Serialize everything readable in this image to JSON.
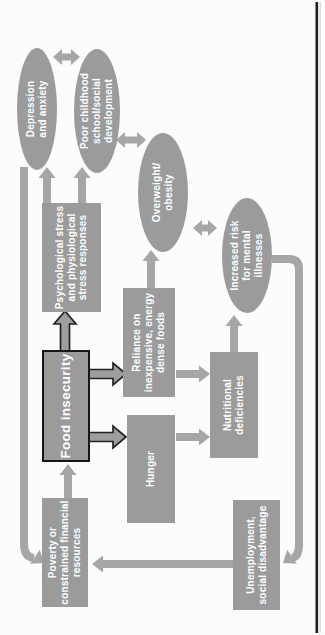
{
  "figure": {
    "colors": {
      "shape_fill": "#9b9b9b",
      "arrow_fill": "#a6a6a6",
      "label_text": "#ffffff",
      "emphasis_outline": "#161616",
      "page_border_line": "#1f1f1f"
    },
    "nodes": {
      "food_insecurity": {
        "label": "Food insecurity",
        "shape": "rect",
        "emphasized": true
      },
      "psychological_stress": {
        "label": "Psychological stress\nand physiological\nstress responses",
        "shape": "rect"
      },
      "reliance": {
        "label": "Reliance on\ninexpensive, energy\ndense foods",
        "shape": "rect"
      },
      "hunger": {
        "label": "Hunger",
        "shape": "rect"
      },
      "nutritional": {
        "label": "Nutritional\ndeficiencies",
        "shape": "rect"
      },
      "poverty": {
        "label": "Poverty or\nconstrained financial\nresources",
        "shape": "rect"
      },
      "unemployment": {
        "label": "Unemployment,\nsocial disadvantage",
        "shape": "rect"
      },
      "depression": {
        "label": "Depression\nand anxiety",
        "shape": "ellipse"
      },
      "poor_childhood": {
        "label": "Poor childhood\nschool/social\ndevelopment",
        "shape": "ellipse"
      },
      "overweight": {
        "label": "Overweight/\nobesity",
        "shape": "ellipse"
      },
      "increased_risk": {
        "label": "Increased risk\nfor mental\nillnesses",
        "shape": "ellipse"
      }
    },
    "edges": [
      {
        "from": "poverty",
        "to": "food_insecurity",
        "type": "arrow"
      },
      {
        "from": "food_insecurity",
        "to": "psychological_stress",
        "type": "arrow-emphasized"
      },
      {
        "from": "food_insecurity",
        "to": "reliance",
        "type": "arrow-emphasized"
      },
      {
        "from": "food_insecurity",
        "to": "hunger",
        "type": "arrow-emphasized"
      },
      {
        "from": "psychological_stress",
        "to": "depression",
        "type": "arrow"
      },
      {
        "from": "psychological_stress",
        "to": "poor_childhood",
        "type": "arrow"
      },
      {
        "from": "reliance",
        "to": "overweight",
        "type": "arrow"
      },
      {
        "from": "reliance",
        "to": "nutritional",
        "type": "arrow"
      },
      {
        "from": "hunger",
        "to": "nutritional",
        "type": "arrow"
      },
      {
        "from": "nutritional",
        "to": "increased_risk",
        "type": "arrow"
      },
      {
        "from": "unemployment",
        "to": "poverty",
        "type": "arrow"
      },
      {
        "from": "depression",
        "to": "poverty",
        "type": "feedback-arrow"
      },
      {
        "from": "increased_risk",
        "to": "unemployment",
        "type": "feedback-arrow"
      },
      {
        "from": "depression",
        "to": "poor_childhood",
        "type": "double-arrow"
      },
      {
        "from": "poor_childhood",
        "to": "overweight",
        "type": "double-arrow"
      },
      {
        "from": "overweight",
        "to": "increased_risk",
        "type": "double-arrow"
      }
    ]
  }
}
